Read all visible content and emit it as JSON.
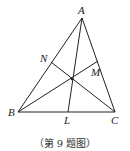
{
  "figure": {
    "caption": "（第 9 题图）",
    "points": {
      "A": {
        "label": "A",
        "x": 82,
        "y": 18
      },
      "B": {
        "label": "B",
        "x": 18,
        "y": 112
      },
      "C": {
        "label": "C",
        "x": 115,
        "y": 112
      },
      "L": {
        "label": "L",
        "x": 68,
        "y": 112
      },
      "M": {
        "label": "M",
        "x": 98,
        "y": 61
      },
      "N": {
        "label": "N",
        "x": 51,
        "y": 62
      },
      "O": {
        "label": "",
        "x": 72,
        "y": 79
      }
    },
    "segments": [
      [
        "A",
        "B"
      ],
      [
        "B",
        "C"
      ],
      [
        "C",
        "A"
      ],
      [
        "A",
        "L"
      ],
      [
        "B",
        "M"
      ],
      [
        "C",
        "N"
      ]
    ],
    "stroke_color": "#222222"
  }
}
